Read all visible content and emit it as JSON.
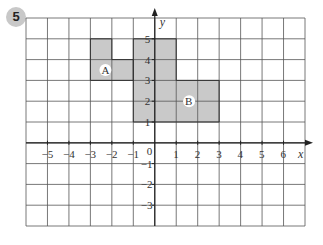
{
  "question_number": "5",
  "grid": {
    "x_min": -6,
    "x_max": 7,
    "y_min": -4,
    "y_max": 6,
    "x_axis_label": "x",
    "y_axis_label": "y",
    "x_tick_labels": [
      "-5",
      "-4",
      "-3",
      "-2",
      "-1",
      "1",
      "2",
      "3",
      "4",
      "5",
      "6"
    ],
    "y_tick_labels": [
      "5",
      "4",
      "3",
      "2",
      "1",
      "-1",
      "-2",
      "-3"
    ],
    "origin_label": "0"
  },
  "shapes": [
    {
      "label": "A",
      "vertices": [
        [
          -3,
          3
        ],
        [
          -1,
          3
        ],
        [
          -1,
          4
        ],
        [
          -2,
          4
        ],
        [
          -2,
          5
        ],
        [
          -3,
          5
        ]
      ],
      "fill": "#c9c9c9"
    },
    {
      "label": "B",
      "vertices": [
        [
          -1,
          1
        ],
        [
          3,
          1
        ],
        [
          3,
          3
        ],
        [
          1,
          3
        ],
        [
          1,
          5
        ],
        [
          -1,
          5
        ]
      ],
      "fill": "#c9c9c9"
    }
  ],
  "colors": {
    "grid": "#555555",
    "axis": "#222222",
    "shape_fill": "#c9c9c9",
    "badge": "#c8c8c8"
  }
}
